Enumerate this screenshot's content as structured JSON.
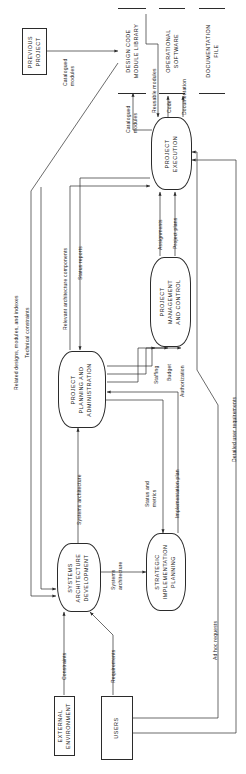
{
  "diagram": {
    "orientation": "rotated-90-ccw",
    "stroke_color": "#2b2b2b",
    "background": "#ffffff"
  },
  "external_entities": [
    {
      "id": "previous-project",
      "label": "PREVIOUS\nPROJECT"
    },
    {
      "id": "external-environment",
      "label": "EXTERNAL\nENVIRONMENT"
    },
    {
      "id": "users",
      "label": "USERS"
    }
  ],
  "processes": [
    {
      "id": "project-execution",
      "label": "PROJECT\nEXECUTION"
    },
    {
      "id": "project-management-and-control",
      "label": "PROJECT\nMANAGEMENT\nAND CONTROL"
    },
    {
      "id": "project-planning-and-administration",
      "label": "PROJECT\nPLANNING AND\nADMINISTRATION"
    },
    {
      "id": "systems-architecture-development",
      "label": "SYSTEMS\nARCHITECTURE\nDEVELOPMENT"
    },
    {
      "id": "strategic-implementation-planning",
      "label": "STRATEGIC\nIMPLEMENTATION\nPLANNING"
    }
  ],
  "data_stores": [
    {
      "id": "design-code-module-library",
      "label": "DESIGN CODE\nMODULE LIBRARY"
    },
    {
      "id": "operational-software",
      "label": "OPERATIONAL\nSOFTWARE"
    },
    {
      "id": "documentation-file",
      "label": "DOCUMENTATION\nFILE"
    }
  ],
  "flow_labels": [
    {
      "id": "catalogued-modules-1",
      "text": "Catalogued\nmodules"
    },
    {
      "id": "catalogued-modules-2",
      "text": "Catalogued\nmodules"
    },
    {
      "id": "reusable-modules",
      "text": "Reusable modules"
    },
    {
      "id": "code",
      "text": "Code"
    },
    {
      "id": "documentation",
      "text": "Documentation"
    },
    {
      "id": "related-designs-modules-and-indexes",
      "text": "Related designs, modules, and indexes"
    },
    {
      "id": "technical-constraints",
      "text": "Technical constraints"
    },
    {
      "id": "relevant-architecture-components",
      "text": "Relevant architecture components"
    },
    {
      "id": "status-reports",
      "text": "Status reports"
    },
    {
      "id": "assignments",
      "text": "Assignments"
    },
    {
      "id": "project-plans",
      "text": "Project plans"
    },
    {
      "id": "staffing",
      "text": "Staffing"
    },
    {
      "id": "budget",
      "text": "Budget"
    },
    {
      "id": "authorization",
      "text": "Authorization"
    },
    {
      "id": "systems-architecture-1",
      "text": "Systems architecture"
    },
    {
      "id": "systems-architecture-2",
      "text": "Systems\narchitecture"
    },
    {
      "id": "status-and-metrics",
      "text": "Status and\nmetrics"
    },
    {
      "id": "implementation-plan",
      "text": "Implementation plan"
    },
    {
      "id": "detailed-user-requirements",
      "text": "Detailed user requirements"
    },
    {
      "id": "ad-hoc-requests",
      "text": "Ad hoc requests"
    },
    {
      "id": "constraints",
      "text": "Constraints"
    },
    {
      "id": "requirements",
      "text": "Requirements"
    }
  ]
}
